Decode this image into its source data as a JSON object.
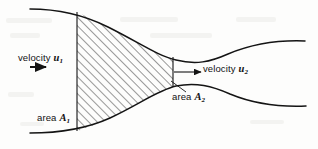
{
  "figure": {
    "kind": "fluid-flow-nozzle-diagram",
    "background_color": "#fdfdfc",
    "line_color": "#141414",
    "hatch_color": "#3a3a3a",
    "labels": {
      "velocity_1": {
        "text": "velocity",
        "symbol": "u",
        "subscript": "1"
      },
      "velocity_2": {
        "text": "velocity",
        "symbol": "u",
        "subscript": "2"
      },
      "area_1": {
        "text": "area",
        "symbol": "A",
        "subscript": "1"
      },
      "area_2": {
        "text": "area",
        "symbol": "A",
        "subscript": "2"
      }
    },
    "geometry": {
      "top_wall": "M 30 9 C 60 9 86 16 108 27 C 140 43 158 56 176 60 C 196 65 210 62 228 54 C 252 44 280 40 305 41",
      "bottom_wall": "M 30 133 C 62 133 88 128 110 118 C 140 104 158 90 176 86 C 196 82 212 86 230 94 C 254 104 282 107 306 106",
      "station_1_x": 77,
      "station_1_top_y": 12,
      "station_1_bottom_y": 131,
      "station_2_x": 173,
      "station_2_top_y": 57,
      "station_2_bottom_y": 87
    },
    "arrows": {
      "u1": {
        "x1": 30,
        "y1": 67,
        "x2": 47,
        "y2": 67
      },
      "u2": {
        "x1": 174,
        "y1": 72,
        "x2": 200,
        "y2": 72
      },
      "a2_leader": {
        "x1": 185,
        "y1": 91,
        "x2": 170,
        "y2": 81
      }
    }
  }
}
